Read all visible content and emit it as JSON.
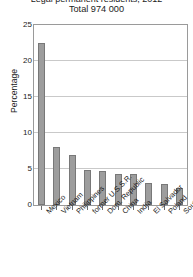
{
  "chart_data": {
    "type": "bar",
    "title": "Legal permanent residents, 2012",
    "subtitle": "Total 974 000",
    "xlabel": "",
    "ylabel": "Percentage",
    "ylim": [
      0,
      25
    ],
    "yticks": [
      0,
      5,
      10,
      15,
      20,
      25
    ],
    "grid": true,
    "legend": false,
    "categories": [
      "Mexico",
      "Vietnam",
      "Philippines",
      "former U.S.S.R.",
      "Dom. Republic",
      "China",
      "India",
      "El Salvador",
      "Poland",
      "South Korea"
    ],
    "values": [
      22.5,
      8.0,
      7.0,
      4.8,
      4.7,
      4.3,
      4.3,
      3.0,
      2.9,
      2.3
    ],
    "bar_color": "#9d9d9d",
    "bar_border_color": "#787878",
    "grid_color": "#c9c9c9",
    "frame_color": "#9a9a9a"
  }
}
